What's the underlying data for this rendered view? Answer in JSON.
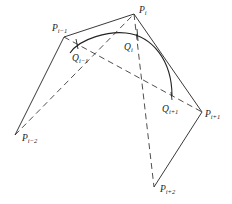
{
  "figure": {
    "type": "b-spline control polygon diagram",
    "control_points": [
      {
        "id": "P_i-2",
        "base": "P",
        "sub": "i−2"
      },
      {
        "id": "P_i-1",
        "base": "P",
        "sub": "i−1"
      },
      {
        "id": "P_i",
        "base": "P",
        "sub": "i"
      },
      {
        "id": "P_i+1",
        "base": "P",
        "sub": "i+1"
      },
      {
        "id": "P_i+2",
        "base": "P",
        "sub": "i+2"
      }
    ],
    "curve_points": [
      {
        "id": "Q_i-1",
        "base": "Q",
        "sub": "i−1"
      },
      {
        "id": "Q_i",
        "base": "Q",
        "sub": "i"
      },
      {
        "id": "Q_i+1",
        "base": "Q",
        "sub": "i+1"
      }
    ],
    "polygon_edges": [
      [
        "P_i-2",
        "P_i-1"
      ],
      [
        "P_i-1",
        "P_i"
      ],
      [
        "P_i",
        "P_i+1"
      ],
      [
        "P_i+1",
        "P_i+2"
      ]
    ],
    "dashed_chords": [
      [
        "P_i-2",
        "P_i"
      ],
      [
        "P_i-1",
        "P_i+1"
      ],
      [
        "P_i",
        "P_i+2"
      ]
    ],
    "colors": {
      "ink": "#222222",
      "background": "#ffffff"
    }
  }
}
